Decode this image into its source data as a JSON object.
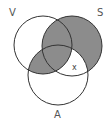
{
  "diagram": {
    "type": "venn-3",
    "sets": [
      {
        "label": "V",
        "cx": 43,
        "cy": 45,
        "r": 29
      },
      {
        "label": "S",
        "cx": 72,
        "cy": 46,
        "r": 30
      },
      {
        "label": "A",
        "cx": 58,
        "cy": 75,
        "r": 30
      }
    ],
    "marker": "x",
    "colors": {
      "shade": "#8c8c8c",
      "stroke": "#333333",
      "background": "#ffffff"
    },
    "shaded_regions": [
      "S only",
      "V∩S only",
      "V∩S∩A",
      "V∩A only"
    ],
    "unshaded_regions": [
      "V only",
      "A only",
      "S∩A only (marked x)"
    ]
  }
}
